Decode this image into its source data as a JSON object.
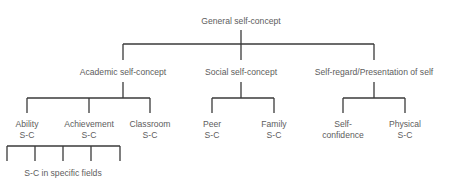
{
  "diagram": {
    "type": "hierarchy-tree",
    "root": {
      "label": "General self-concept"
    },
    "level2": [
      {
        "label": "Academic self-concept",
        "children": [
          {
            "line1": "Ability",
            "line2": "S-C"
          },
          {
            "line1": "Achievement",
            "line2": "S-C"
          },
          {
            "line1": "Classroom",
            "line2": "S-C"
          }
        ]
      },
      {
        "label": "Social self-concept",
        "children": [
          {
            "line1": "Peer",
            "line2": "S-C"
          },
          {
            "line1": "Family",
            "line2": "S-C"
          }
        ]
      },
      {
        "label": "Self-regard/Presentation of self",
        "children": [
          {
            "line1": "Self-",
            "line2": "confidence"
          },
          {
            "line1": "Physical",
            "line2": "S-C"
          }
        ]
      }
    ],
    "level4": {
      "label": "S-C in specific fields",
      "branch_count": 5
    },
    "line_color": "#3a3a3a",
    "text_color": "#5d5d5d"
  }
}
